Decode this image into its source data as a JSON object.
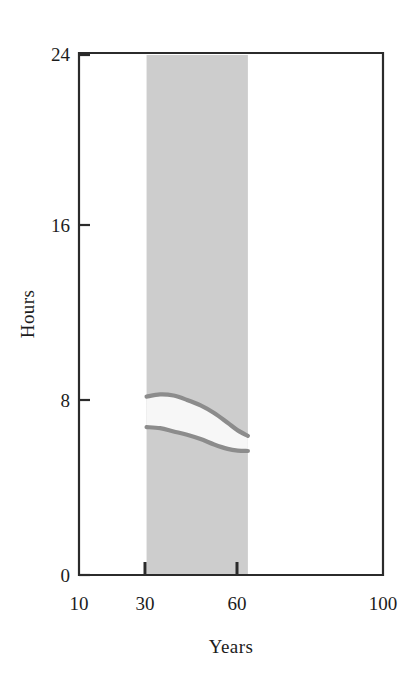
{
  "chart_data": {
    "type": "area",
    "title": "",
    "subtitle": "",
    "xlabel": "Years",
    "ylabel": "Hours",
    "xlim": [
      10,
      100
    ],
    "ylim": [
      0,
      24
    ],
    "grid": false,
    "legend": null,
    "xticks": [
      10,
      30,
      60,
      100
    ],
    "xtick_labels": [
      "10",
      "30",
      "60",
      "100"
    ],
    "yticks": [
      0,
      8,
      16,
      24
    ],
    "ytick_labels": [
      "0",
      "8",
      "16",
      "24"
    ],
    "shaded_band": {
      "name": "highlighted-year-range",
      "x_start": 30,
      "x_end": 60,
      "y_start": 0,
      "y_end": 24,
      "color": "#cdcdcd"
    },
    "series": [
      {
        "name": "upper-bound",
        "color": "#8c8c8c",
        "x": [
          30,
          34,
          38,
          42,
          46,
          50,
          54,
          57,
          60
        ],
        "values": [
          8.2,
          8.3,
          8.25,
          8.05,
          7.8,
          7.45,
          7.0,
          6.65,
          6.4
        ]
      },
      {
        "name": "lower-bound",
        "color": "#8c8c8c",
        "x": [
          30,
          34,
          38,
          42,
          46,
          50,
          54,
          57,
          60
        ],
        "values": [
          6.8,
          6.75,
          6.6,
          6.45,
          6.25,
          6.0,
          5.8,
          5.72,
          5.7
        ]
      }
    ],
    "band_between": {
      "name": "sleep-hours-range",
      "fill": "#f7f7f7",
      "upper_series": "upper-bound",
      "lower_series": "lower-bound"
    },
    "annotations": []
  },
  "axes": {
    "y_axis_label": "Hours",
    "x_axis_label": "Years",
    "y_tick_0": "0",
    "y_tick_8": "8",
    "y_tick_16": "16",
    "y_tick_24": "24",
    "x_tick_10": "10",
    "x_tick_30": "30",
    "x_tick_60": "60",
    "x_tick_100": "100"
  },
  "colors": {
    "frame": "#2b2b2b",
    "band": "#cdcdcd",
    "curve": "#8c8c8c",
    "inner_fill": "#f7f7f7",
    "text": "#1c1c1c",
    "background": "#ffffff"
  }
}
